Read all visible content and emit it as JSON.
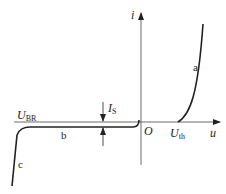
{
  "diagram": {
    "axes": {
      "x_label": "u",
      "y_label": "i",
      "origin_label": "O"
    },
    "markers": {
      "breakdown": {
        "main": "U",
        "sub": "BR"
      },
      "threshold": {
        "main": "U",
        "sub": "th"
      },
      "saturation": {
        "main": "I",
        "sub": "S"
      }
    },
    "regions": {
      "forward": "a",
      "reverse": "b",
      "breakdown": "c"
    }
  }
}
